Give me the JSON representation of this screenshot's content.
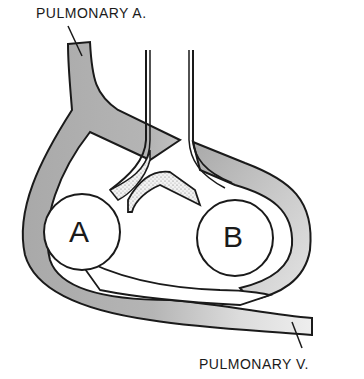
{
  "labels": {
    "pulmonary_artery": "PULMONARY A.",
    "pulmonary_vein": "PULMONARY V.",
    "circle_a": "A",
    "circle_b": "B"
  },
  "colors": {
    "vessel_fill": "#a9a9a9",
    "vessel_light": "#d6d6d6",
    "outline": "#1a1a1a",
    "background": "#ffffff"
  }
}
